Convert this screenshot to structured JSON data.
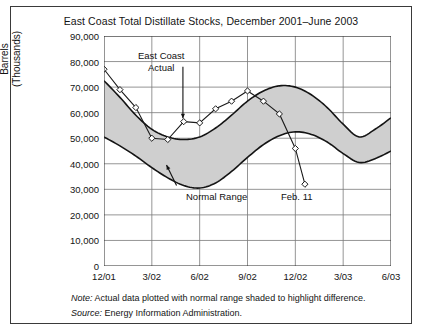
{
  "figure": {
    "title": "East Coast Total Distillate Stocks, December 2001–June 2003",
    "note_label": "Note:",
    "note_text": " Actual data plotted with normal range shaded to highlight difference.",
    "source_label": "Source:",
    "source_text": " Energy Information Administration."
  },
  "annotations": {
    "east_coast_line1": "East Coast",
    "east_coast_line2": "Actual",
    "normal_range": "Normal Range",
    "feb11": "Feb. 11"
  },
  "colors": {
    "band_fill": "#cfcfcf",
    "band_stroke": "#141414",
    "actual_line": "#1a1a1a",
    "grid": "#7a7a7a",
    "axis": "#2b2b2b",
    "frame": "#3a3a3a",
    "text": "#141414"
  },
  "chart_data": {
    "type": "area",
    "title": "East Coast Total Distillate Stocks, December 2001–June 2003",
    "xlabel": "",
    "ylabel": "Barrels (Thousands)",
    "ylabel_line1": "Barrels",
    "ylabel_line2": "(Thousands)",
    "ylim": [
      0,
      90000
    ],
    "ytick_values": [
      0,
      10000,
      20000,
      30000,
      40000,
      50000,
      60000,
      70000,
      80000,
      90000
    ],
    "ytick_labels": [
      "0",
      "10,000",
      "20,000",
      "30,000",
      "40,000",
      "50,000",
      "60,000",
      "70,000",
      "80,000",
      "90,000"
    ],
    "xtick_labels": [
      "12/01",
      "3/02",
      "6/02",
      "9/02",
      "12/02",
      "3/03",
      "6/03"
    ],
    "xtick_positions": [
      0,
      3,
      6,
      9,
      12,
      15,
      18
    ],
    "xlim": [
      0,
      18
    ],
    "grid": true,
    "legend": false,
    "x_months": [
      0,
      1,
      2,
      3,
      4,
      5,
      6,
      7,
      8,
      9,
      10,
      11,
      12,
      13,
      14,
      15,
      16,
      17,
      18
    ],
    "series": [
      {
        "name": "Normal Range Upper",
        "type": "band-upper",
        "values": [
          72500,
          66000,
          59000,
          53500,
          50500,
          49500,
          50500,
          54000,
          59000,
          64500,
          68500,
          70500,
          70000,
          67000,
          62000,
          55500,
          50500,
          53500,
          58000
        ]
      },
      {
        "name": "Normal Range Lower",
        "type": "band-lower",
        "values": [
          50500,
          47000,
          43000,
          38500,
          34500,
          31500,
          30500,
          32500,
          37000,
          42500,
          47500,
          51000,
          52500,
          51500,
          48500,
          44000,
          40500,
          42000,
          45000
        ]
      },
      {
        "name": "East Coast Actual",
        "type": "line-markers",
        "marker": "diamond",
        "x": [
          0,
          1,
          2,
          3,
          4,
          5,
          6,
          7,
          8,
          9,
          10,
          11,
          12,
          12.6
        ],
        "values": [
          77000,
          69000,
          62000,
          50000,
          49500,
          56500,
          56000,
          61500,
          64500,
          68500,
          64500,
          59500,
          46000,
          32000
        ]
      }
    ],
    "annotation_points": [
      {
        "label": "East Coast Actual",
        "x": 5.0,
        "y": 56500
      },
      {
        "label": "Normal Range",
        "x": 4.2,
        "y": 36500
      },
      {
        "label": "Feb. 11",
        "x": 12.6,
        "y": 32000
      }
    ]
  }
}
